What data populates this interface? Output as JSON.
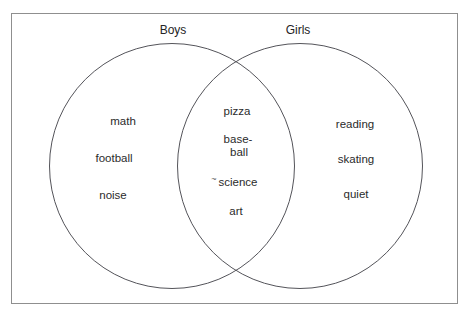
{
  "venn": {
    "left_set": {
      "label": "Boys",
      "items": [
        "math",
        "football",
        "noise"
      ]
    },
    "right_set": {
      "label": "Girls",
      "items": [
        "reading",
        "skating",
        "quiet"
      ]
    },
    "overlap": {
      "items": [
        "pizza",
        "base-",
        "ball",
        "science",
        "art"
      ],
      "stray_mark": "~"
    }
  },
  "colors": {
    "background": "#ffffff",
    "frame_border": "#8f8f8f",
    "circle_stroke": "#54545a",
    "text": "#2b2b2b"
  }
}
